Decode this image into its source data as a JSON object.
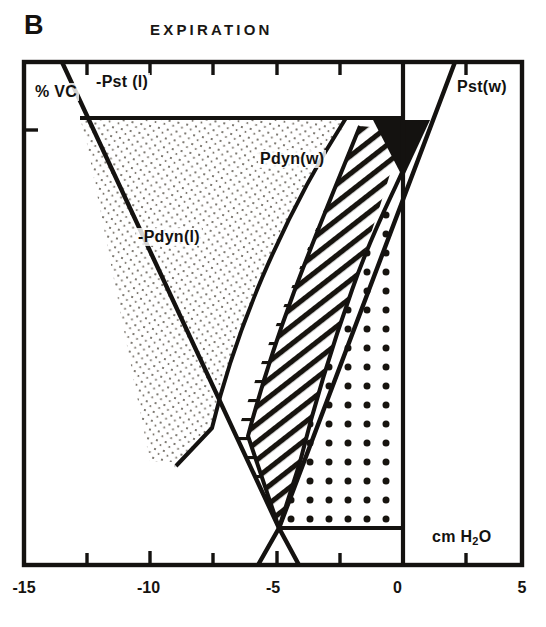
{
  "figure": {
    "panel_letter": "B",
    "title": "EXPIRATION",
    "y_axis_label": "% VC",
    "x_axis_unit_label": "cm H2O"
  },
  "labels": {
    "pst_l": "-Pst (l)",
    "pst_w": "Pst(w)",
    "pdyn_w": "Pdyn(w)",
    "pdyn_l": "-Pdyn(l)"
  },
  "chart_data": {
    "type": "area",
    "title": "EXPIRATION",
    "xlabel": "cm H2O",
    "ylabel": "% VC",
    "xlim": [
      -15,
      5
    ],
    "ylim": [
      0,
      100
    ],
    "grid": false,
    "legend_position": "inline-annotations",
    "x_ticks": [
      -15,
      -12.5,
      -10,
      -7.5,
      -5,
      -2.5,
      0,
      2.5,
      5
    ],
    "x_tick_labels": [
      "-15",
      "",
      "-10",
      "",
      "-5",
      "",
      "0",
      "",
      "5"
    ],
    "annotations": [
      {
        "text": "-Pst (l)",
        "x": -12.2,
        "y": 93,
        "note": "static recoil pressure of the lung, negative"
      },
      {
        "text": "Pst(w)",
        "x": 1.4,
        "y": 93,
        "note": "static recoil pressure of the chest wall"
      },
      {
        "text": "Pdyn(w)",
        "x": -5.4,
        "y": 80,
        "note": "dynamic pressure of chest wall, horizontal hatch region"
      },
      {
        "text": "-Pdyn(l)",
        "x": -10.6,
        "y": 65,
        "note": "dynamic pressure of lung, fine stipple region"
      }
    ],
    "series": [
      {
        "name": "-Pst (l)",
        "style": "line",
        "points": [
          [
            -13.5,
            100
          ],
          [
            -5.0,
            7.5
          ],
          [
            -4.2,
            0
          ]
        ]
      },
      {
        "name": "Pst(w)",
        "style": "line",
        "points": [
          [
            1.2,
            100
          ],
          [
            -5.0,
            7.5
          ],
          [
            -5.8,
            0
          ]
        ]
      },
      {
        "name": "-Pdyn(l) boundary",
        "style": "curve",
        "points": [
          [
            -12.0,
            89
          ],
          [
            -9.5,
            62
          ],
          [
            -7.2,
            38
          ],
          [
            -5.8,
            20
          ],
          [
            -5.0,
            7.5
          ]
        ]
      },
      {
        "name": "Pdyn(w) boundary",
        "style": "curve",
        "points": [
          [
            -0.4,
            89
          ],
          [
            -2.0,
            62
          ],
          [
            -3.3,
            38
          ],
          [
            -4.3,
            20
          ],
          [
            -5.0,
            7.5
          ]
        ]
      }
    ],
    "regions": [
      {
        "name": "-Pdyn(l)",
        "fill": "fine-stipple",
        "description": "Light stippled lens between -Pst(l) line and inner curve"
      },
      {
        "name": "Pdyn(w)",
        "fill": "horizontal-lines",
        "description": "Horizontally ruled region in upper middle"
      },
      {
        "name": "Pdyn(w) lower",
        "fill": "diagonal-hatch",
        "description": "Diagonally hatched wedge descending to convergence point"
      },
      {
        "name": "Pst(w)",
        "fill": "bold-dots",
        "description": "Bold dotted region bounded right by the zero line"
      },
      {
        "name": "overlap",
        "fill": "solid-black",
        "description": "Solid black triangle just right of zero line near top"
      }
    ]
  },
  "colors": {
    "ink": "#15120f",
    "background": "#ffffff",
    "stipple": "#4a463f"
  }
}
